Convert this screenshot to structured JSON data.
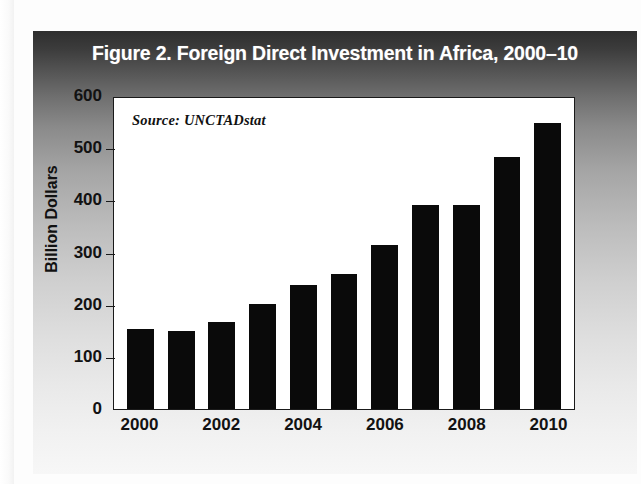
{
  "figure": {
    "title": "Figure 2. Foreign Direct Investment in Africa, 2000–10",
    "source_note": "Source: UNCTADstat",
    "title_bar_color": "#2e2e2e",
    "bar_color": "#0a0a0a",
    "plot_background": "#ffffff",
    "axis_color": "#1a1a1a"
  },
  "chart_data": {
    "type": "bar",
    "title": "Figure 2. Foreign Direct Investment in Africa, 2000–10",
    "xlabel": "",
    "ylabel": "Billion Dollars",
    "ylim": [
      0,
      600
    ],
    "yticks": [
      0,
      100,
      200,
      300,
      400,
      500,
      600
    ],
    "ytick_labels": [
      "0",
      "100",
      "200",
      "300",
      "400",
      "500",
      "600"
    ],
    "grid": false,
    "legend": false,
    "annotations": [
      "Source: UNCTADstat"
    ],
    "categories": [
      "2000",
      "2001",
      "2002",
      "2003",
      "2004",
      "2005",
      "2006",
      "2007",
      "2008",
      "2009",
      "2010"
    ],
    "xtick_labels": [
      "2000",
      "2002",
      "2004",
      "2006",
      "2008",
      "2010"
    ],
    "values": [
      155,
      150,
      168,
      203,
      239,
      261,
      316,
      394,
      393,
      487,
      552
    ],
    "series": [
      {
        "name": "Foreign Direct Investment in Africa",
        "units": "Billion Dollars",
        "values": [
          155,
          150,
          168,
          203,
          239,
          261,
          316,
          394,
          393,
          487,
          552
        ]
      }
    ]
  }
}
